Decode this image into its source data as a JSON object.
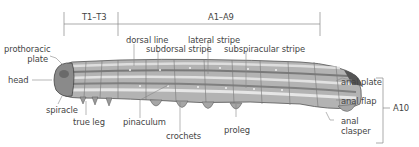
{
  "diagram": {
    "segments": {
      "thorax": "T1–T3",
      "abdomen": "A1–A9",
      "terminal": "A10"
    },
    "labels": {
      "prothoracic_plate": [
        "prothoracic",
        "plate"
      ],
      "head": "head",
      "spiracle": "spiracle",
      "true_leg": "true leg",
      "dorsal_line": "dorsal line",
      "subdorsal_stripe": "subdorsal stripe",
      "lateral_stripe": "lateral stripe",
      "subspiracular_stripe": "subspiracular stripe",
      "pinaculum": "pinaculum",
      "crochets": "crochets",
      "proleg": "proleg",
      "anal_plate": "anal plate",
      "anal_flap": "anal flap",
      "anal_clasper": [
        "anal",
        "clasper"
      ]
    },
    "colors": {
      "line": "#888888",
      "text": "#444444",
      "body_dark": "#6f6f6f",
      "body_mid": "#a9a9a9",
      "body_light": "#dcdcdc"
    }
  }
}
